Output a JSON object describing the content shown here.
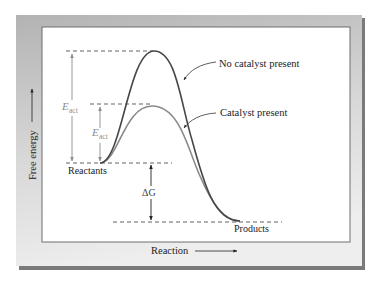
{
  "diagram": {
    "type": "energy_profile",
    "axes": {
      "y_label": "Free energy",
      "x_label": "Reaction"
    },
    "curves": [
      {
        "name": "No catalyst present",
        "color": "#474747"
      },
      {
        "name": "Catalyst present",
        "color": "#8a8a8a"
      }
    ],
    "labels": {
      "no_catalyst": "No catalyst present",
      "catalyst": "Catalyst present",
      "reactants": "Reactants",
      "products": "Products",
      "eact_symbol": "E",
      "eact_subscript": "act",
      "delta_g": "ΔG"
    },
    "colors": {
      "frame_top": "#b9b9b9",
      "frame_bottom": "#ebebeb",
      "frame_shadow": "#7a7a7a",
      "panel": "#ffffff",
      "panel_border": "#6f6f6f",
      "dash": "#3a3a3a",
      "eact_arrow": "#8c8c8c",
      "delta_g_arrow": "#222222"
    }
  }
}
